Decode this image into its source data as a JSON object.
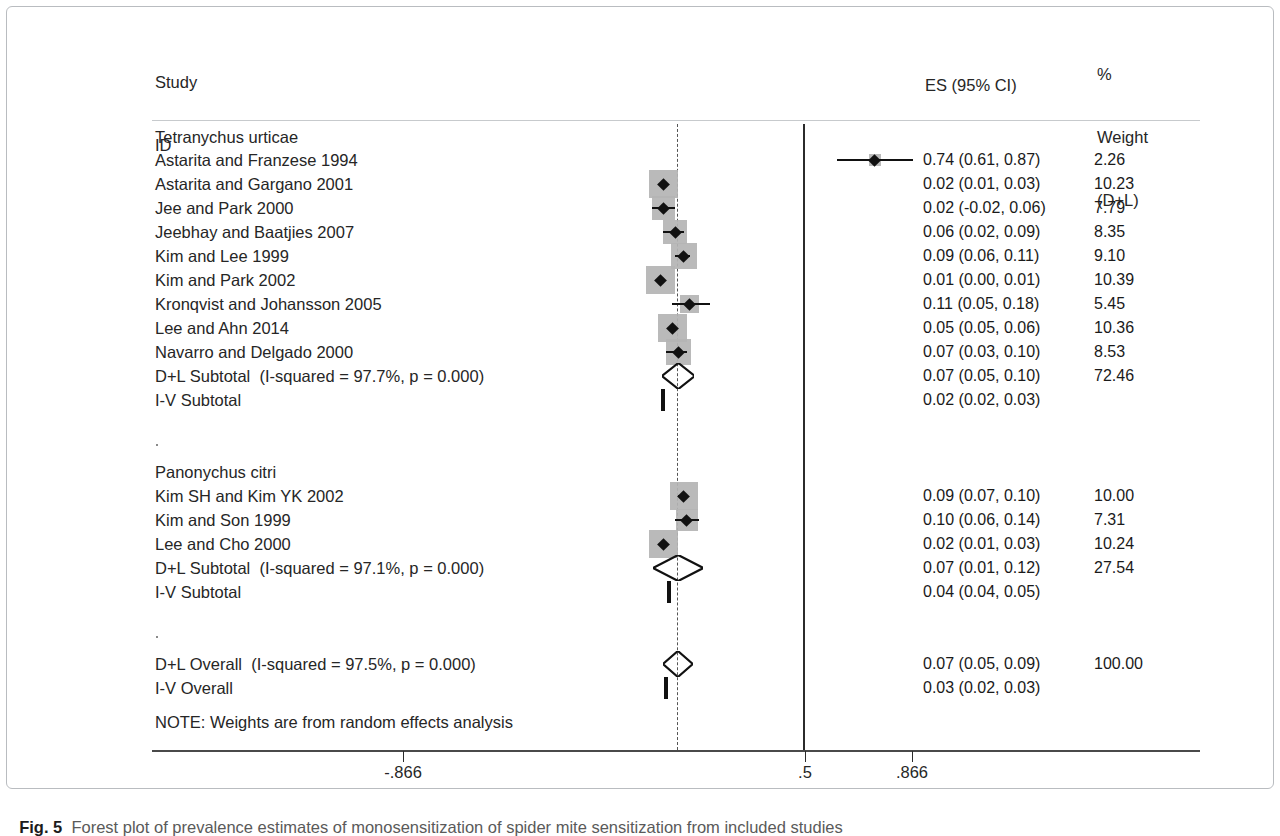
{
  "figure": {
    "label": "Fig. 5",
    "caption": "Forest plot of prevalence estimates of monosensitization of spider mite sensitization from included studies"
  },
  "header": {
    "study_line1": "Study",
    "study_line2": "ID",
    "es_header": "ES (95% CI)",
    "weight_line1": "%",
    "weight_line2": "Weight",
    "weight_line3": "(D+L)"
  },
  "note": "NOTE: Weights are from random effects analysis",
  "axis": {
    "ticks": [
      {
        "label": "-.866",
        "value": -0.866,
        "x": 403
      },
      {
        "label": ".5",
        "value": 0.5,
        "x": 805
      },
      {
        "label": ".866",
        "value": 0.866,
        "x": 912
      }
    ],
    "null_line_value": 0.5,
    "pooled_line_value": 0.07
  },
  "chart_data": {
    "type": "forest",
    "title": "Forest plot of prevalence estimates of monosensitization of spider mite sensitization from included studies",
    "xlabel": "",
    "ylabel": "",
    "effect_measure": "ES (95% CI)",
    "weight_label": "% Weight (D+L)",
    "xlim": [
      -0.866,
      1.0
    ],
    "xticks": [
      -0.866,
      0.5,
      0.866
    ],
    "reference_line": 0.5,
    "pooled_line": 0.07,
    "groups": [
      {
        "name": "Tetranychus urticae",
        "studies": [
          {
            "label": "Astarita and Franzese 1994",
            "es": 0.74,
            "lcl": 0.61,
            "ucl": 0.87,
            "es_text": "0.74 (0.61, 0.87)",
            "weight": 2.26,
            "weight_text": "2.26"
          },
          {
            "label": "Astarita and Gargano 2001",
            "es": 0.02,
            "lcl": 0.01,
            "ucl": 0.03,
            "es_text": "0.02 (0.01, 0.03)",
            "weight": 10.23,
            "weight_text": "10.23"
          },
          {
            "label": "Jee and Park 2000",
            "es": 0.02,
            "lcl": -0.02,
            "ucl": 0.06,
            "es_text": "0.02 (-0.02, 0.06)",
            "weight": 7.79,
            "weight_text": "7.79"
          },
          {
            "label": "Jeebhay and Baatjies 2007",
            "es": 0.06,
            "lcl": 0.02,
            "ucl": 0.09,
            "es_text": "0.06 (0.02, 0.09)",
            "weight": 8.35,
            "weight_text": "8.35"
          },
          {
            "label": "Kim and Lee 1999",
            "es": 0.09,
            "lcl": 0.06,
            "ucl": 0.11,
            "es_text": "0.09 (0.06, 0.11)",
            "weight": 9.1,
            "weight_text": "9.10"
          },
          {
            "label": "Kim and Park 2002",
            "es": 0.01,
            "lcl": 0.0,
            "ucl": 0.01,
            "es_text": "0.01 (0.00, 0.01)",
            "weight": 10.39,
            "weight_text": "10.39"
          },
          {
            "label": "Kronqvist and Johansson 2005",
            "es": 0.11,
            "lcl": 0.05,
            "ucl": 0.18,
            "es_text": "0.11 (0.05, 0.18)",
            "weight": 5.45,
            "weight_text": "5.45"
          },
          {
            "label": "Lee and Ahn 2014",
            "es": 0.05,
            "lcl": 0.05,
            "ucl": 0.06,
            "es_text": "0.05 (0.05, 0.06)",
            "weight": 10.36,
            "weight_text": "10.36"
          },
          {
            "label": "Navarro and Delgado 2000",
            "es": 0.07,
            "lcl": 0.03,
            "ucl": 0.1,
            "es_text": "0.07 (0.03, 0.10)",
            "weight": 8.53,
            "weight_text": "8.53"
          }
        ],
        "summaries": [
          {
            "label": "D+L Subtotal  (I-squared = 97.7%, p = 0.000)",
            "kind": "diamond",
            "es": 0.07,
            "lcl": 0.05,
            "ucl": 0.1,
            "es_text": "0.07 (0.05, 0.10)",
            "weight": 72.46,
            "weight_text": "72.46"
          },
          {
            "label": "I-V Subtotal",
            "kind": "bar",
            "es": 0.02,
            "lcl": 0.02,
            "ucl": 0.03,
            "es_text": "0.02 (0.02, 0.03)",
            "weight": null,
            "weight_text": ""
          }
        ]
      },
      {
        "name": "Panonychus citri",
        "studies": [
          {
            "label": "Kim SH and Kim YK 2002",
            "es": 0.09,
            "lcl": 0.07,
            "ucl": 0.1,
            "es_text": "0.09 (0.07, 0.10)",
            "weight": 10.0,
            "weight_text": "10.00"
          },
          {
            "label": "Kim and Son 1999",
            "es": 0.1,
            "lcl": 0.06,
            "ucl": 0.14,
            "es_text": "0.10 (0.06, 0.14)",
            "weight": 7.31,
            "weight_text": "7.31"
          },
          {
            "label": "Lee and Cho 2000",
            "es": 0.02,
            "lcl": 0.01,
            "ucl": 0.03,
            "es_text": "0.02 (0.01, 0.03)",
            "weight": 10.24,
            "weight_text": "10.24"
          }
        ],
        "summaries": [
          {
            "label": "D+L Subtotal  (I-squared = 97.1%, p = 0.000)",
            "kind": "diamond",
            "es": 0.07,
            "lcl": 0.01,
            "ucl": 0.12,
            "es_text": "0.07 (0.01, 0.12)",
            "weight": 27.54,
            "weight_text": "27.54"
          },
          {
            "label": "I-V Subtotal",
            "kind": "bar",
            "es": 0.04,
            "lcl": 0.04,
            "ucl": 0.05,
            "es_text": "0.04 (0.04, 0.05)",
            "weight": null,
            "weight_text": ""
          }
        ]
      }
    ],
    "overall": [
      {
        "label": "D+L Overall  (I-squared = 97.5%, p = 0.000)",
        "kind": "diamond",
        "es": 0.07,
        "lcl": 0.05,
        "ucl": 0.09,
        "es_text": "0.07 (0.05, 0.09)",
        "weight": 100.0,
        "weight_text": "100.00"
      },
      {
        "label": "I-V Overall",
        "kind": "bar",
        "es": 0.03,
        "lcl": 0.02,
        "ucl": 0.03,
        "es_text": "0.03 (0.02, 0.03)",
        "weight": null,
        "weight_text": ""
      }
    ]
  },
  "rows": [
    {
      "y": 137,
      "type": "group",
      "label": "Tetranychus urticae"
    },
    {
      "y": 160,
      "type": "study",
      "label": "Astarita and Franzese 1994",
      "es": 0.74,
      "lcl": 0.61,
      "ucl": 0.87,
      "es_text": "0.74 (0.61, 0.87)",
      "weight_text": "2.26",
      "box": 2.26
    },
    {
      "y": 184,
      "type": "study",
      "label": "Astarita and Gargano 2001",
      "es": 0.02,
      "lcl": 0.01,
      "ucl": 0.03,
      "es_text": "0.02 (0.01, 0.03)",
      "weight_text": "10.23",
      "box": 10.23
    },
    {
      "y": 208,
      "type": "study",
      "label": "Jee and Park 2000",
      "es": 0.02,
      "lcl": -0.02,
      "ucl": 0.06,
      "es_text": "0.02 (-0.02, 0.06)",
      "weight_text": "7.79",
      "box": 7.79
    },
    {
      "y": 232,
      "type": "study",
      "label": "Jeebhay and Baatjies 2007",
      "es": 0.06,
      "lcl": 0.02,
      "ucl": 0.09,
      "es_text": "0.06 (0.02, 0.09)",
      "weight_text": "8.35",
      "box": 8.35
    },
    {
      "y": 256,
      "type": "study",
      "label": "Kim and Lee 1999",
      "es": 0.09,
      "lcl": 0.06,
      "ucl": 0.11,
      "es_text": "0.09 (0.06, 0.11)",
      "weight_text": "9.10",
      "box": 9.1
    },
    {
      "y": 280,
      "type": "study",
      "label": "Kim and Park 2002",
      "es": 0.01,
      "lcl": 0.0,
      "ucl": 0.01,
      "es_text": "0.01 (0.00, 0.01)",
      "weight_text": "10.39",
      "box": 10.39
    },
    {
      "y": 304,
      "type": "study",
      "label": "Kronqvist and Johansson 2005",
      "es": 0.11,
      "lcl": 0.05,
      "ucl": 0.18,
      "es_text": "0.11 (0.05, 0.18)",
      "weight_text": "5.45",
      "box": 5.45
    },
    {
      "y": 328,
      "type": "study",
      "label": "Lee and Ahn 2014",
      "es": 0.05,
      "lcl": 0.05,
      "ucl": 0.06,
      "es_text": "0.05 (0.05, 0.06)",
      "weight_text": "10.36",
      "box": 10.36
    },
    {
      "y": 352,
      "type": "study",
      "label": "Navarro and Delgado 2000",
      "es": 0.07,
      "lcl": 0.03,
      "ucl": 0.1,
      "es_text": "0.07 (0.03, 0.10)",
      "weight_text": "8.53",
      "box": 8.53
    },
    {
      "y": 376,
      "type": "diamond",
      "label": "D+L Subtotal  (I-squared = 97.7%, p = 0.000)",
      "es": 0.07,
      "lcl": 0.05,
      "ucl": 0.1,
      "es_text": "0.07 (0.05, 0.10)",
      "weight_text": "72.46"
    },
    {
      "y": 400,
      "type": "ivbar",
      "label": "I-V Subtotal",
      "es": 0.02,
      "lcl": 0.02,
      "ucl": 0.03,
      "es_text": "0.02 (0.02, 0.03)",
      "weight_text": ""
    },
    {
      "y": 448,
      "type": "dot"
    },
    {
      "y": 472,
      "type": "group",
      "label": "Panonychus citri"
    },
    {
      "y": 496,
      "type": "study",
      "label": "Kim SH and Kim YK 2002",
      "es": 0.09,
      "lcl": 0.07,
      "ucl": 0.1,
      "es_text": "0.09 (0.07, 0.10)",
      "weight_text": "10.00",
      "box": 10.0
    },
    {
      "y": 520,
      "type": "study",
      "label": "Kim and Son 1999",
      "es": 0.1,
      "lcl": 0.06,
      "ucl": 0.14,
      "es_text": "0.10 (0.06, 0.14)",
      "weight_text": "7.31",
      "box": 7.31
    },
    {
      "y": 544,
      "type": "study",
      "label": "Lee and Cho 2000",
      "es": 0.02,
      "lcl": 0.01,
      "ucl": 0.03,
      "es_text": "0.02 (0.01, 0.03)",
      "weight_text": "10.24",
      "box": 10.24
    },
    {
      "y": 568,
      "type": "diamond",
      "label": "D+L Subtotal  (I-squared = 97.1%, p = 0.000)",
      "es": 0.07,
      "lcl": 0.01,
      "ucl": 0.12,
      "es_text": "0.07 (0.01, 0.12)",
      "weight_text": "27.54"
    },
    {
      "y": 592,
      "type": "ivbar",
      "label": "I-V Subtotal",
      "es": 0.04,
      "lcl": 0.04,
      "ucl": 0.05,
      "es_text": "0.04 (0.04, 0.05)",
      "weight_text": ""
    },
    {
      "y": 640,
      "type": "dot"
    },
    {
      "y": 664,
      "type": "diamond",
      "label": "D+L Overall  (I-squared = 97.5%, p = 0.000)",
      "es": 0.07,
      "lcl": 0.05,
      "ucl": 0.09,
      "es_text": "0.07 (0.05, 0.09)",
      "weight_text": "100.00"
    },
    {
      "y": 688,
      "type": "ivbar",
      "label": "I-V Overall",
      "es": 0.03,
      "lcl": 0.02,
      "ucl": 0.03,
      "es_text": "0.03 (0.02, 0.03)",
      "weight_text": ""
    },
    {
      "y": 722,
      "type": "note",
      "label": "NOTE: Weights are from random effects analysis"
    }
  ]
}
